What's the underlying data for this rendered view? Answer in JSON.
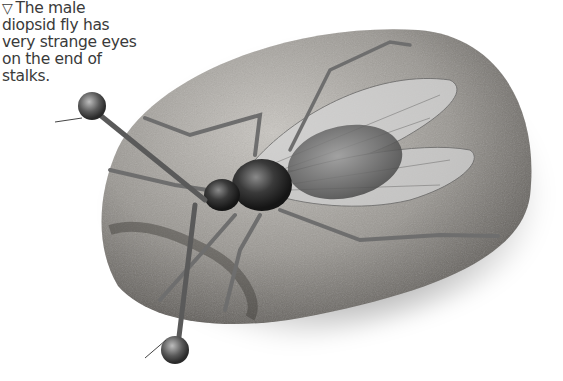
{
  "caption": {
    "marker_icon": "▽",
    "text": "The male diopsid fly has very strange eyes on the end of stalks."
  },
  "illustration": {
    "subject": "male diopsid (stalk-eyed) fly on a stone",
    "style": "grayscale airbrush illustration",
    "colors": {
      "background": "#ffffff",
      "stone_light": "#b8b6b2",
      "stone_dark": "#55524e",
      "body_dark": "#2a2a2a",
      "wing": "#c8c8c8"
    }
  }
}
